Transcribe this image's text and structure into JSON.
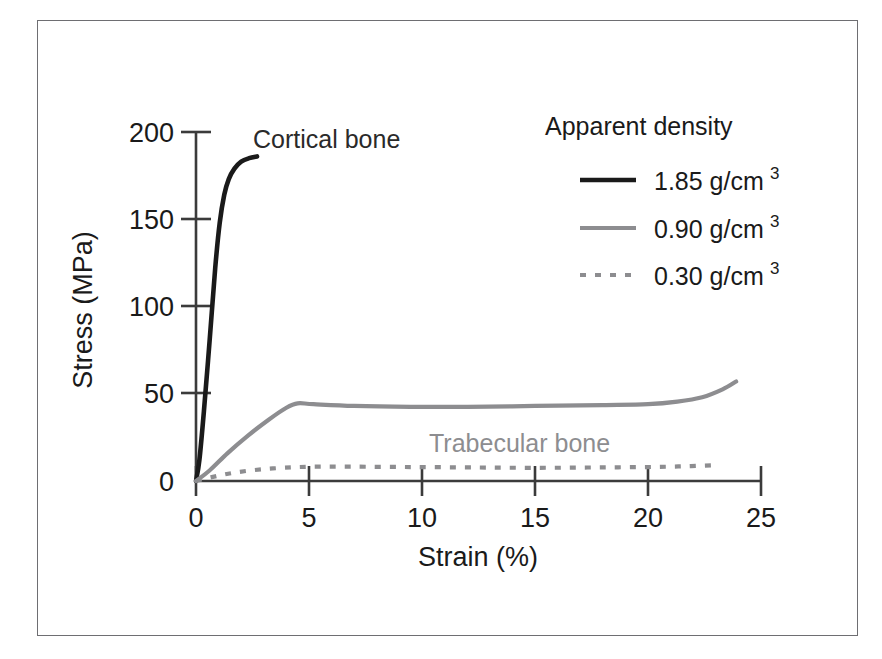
{
  "chart_data": {
    "type": "line",
    "title": "",
    "xlabel": "Strain (%)",
    "ylabel": "Stress (MPa)",
    "xlim": [
      0,
      25
    ],
    "ylim": [
      0,
      200
    ],
    "xticks": [
      "0",
      "5",
      "10",
      "15",
      "20",
      "25"
    ],
    "xtick_values": [
      0,
      5,
      10,
      15,
      20,
      25
    ],
    "yticks": [
      "0",
      "50",
      "100",
      "150",
      "200"
    ],
    "ytick_values": [
      0,
      50,
      100,
      150,
      200
    ],
    "grid": false,
    "legend_position": "top-right",
    "legend_title": "Apparent density",
    "series": [
      {
        "name": "1.85 g/cm3",
        "legend_label": "1.85 g/cm",
        "legend_exponent": "3",
        "style": "solid-thick",
        "color": "#1a1a1a",
        "annotation": "Cortical bone",
        "x": [
          0.0,
          0.15,
          0.35,
          0.6,
          0.85,
          1.05,
          1.25,
          1.45,
          1.7,
          2.0,
          2.35,
          2.7
        ],
        "y": [
          0,
          12,
          40,
          80,
          122,
          148,
          164,
          173,
          179,
          183,
          185,
          186
        ]
      },
      {
        "name": "0.90 g/cm3",
        "legend_label": "0.90 g/cm",
        "legend_exponent": "3",
        "style": "solid-medium",
        "color": "#8d8d90",
        "annotation": "Trabecular bone",
        "x": [
          0.0,
          0.6,
          1.4,
          2.3,
          3.2,
          4.0,
          4.5,
          5.2,
          7.0,
          9.5,
          12.0,
          15.0,
          18.0,
          20.0,
          21.3,
          22.4,
          23.3,
          23.9
        ],
        "y": [
          0,
          6,
          16,
          26,
          35,
          42,
          44.5,
          44,
          43,
          42.5,
          42.5,
          43,
          43.5,
          44,
          45.5,
          48,
          52.5,
          57
        ]
      },
      {
        "name": "0.30 g/cm3",
        "legend_label": "0.30 g/cm",
        "legend_exponent": "3",
        "style": "dotted",
        "color": "#8d8d90",
        "annotation": "",
        "x": [
          0.0,
          0.8,
          1.8,
          3.0,
          4.2,
          5.2,
          7.0,
          9.5,
          12.0,
          14.0,
          16.0,
          18.0,
          20.0,
          21.5,
          22.8
        ],
        "y": [
          0,
          2.5,
          5.0,
          6.8,
          7.8,
          8.2,
          8.2,
          8.0,
          7.8,
          7.6,
          7.6,
          7.8,
          8.0,
          8.4,
          9.0
        ]
      }
    ],
    "annotations": [
      {
        "text": "Cortical bone",
        "color": "#2a2a2a",
        "x_px": 253,
        "y_px": 148
      },
      {
        "text": "Trabecular bone",
        "color": "#8d8d90",
        "x_px": 429,
        "y_px": 452
      }
    ]
  },
  "colors": {
    "cortical": "#1a1a1a",
    "trabecular": "#8d8d90",
    "axis": "#3b3b3b",
    "frame": "#6e6e72",
    "background": "#ffffff"
  }
}
